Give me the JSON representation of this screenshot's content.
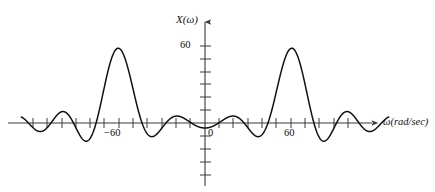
{
  "figure": {
    "name": "fourier-transform-magnitude-spectrum",
    "background_color": "#ffffff",
    "curve_color": "#111111",
    "axis_color": "#3a3a3a"
  },
  "labels": {
    "y_axis_label": "X(ω)",
    "x_axis_label": "ω(rad/sec)",
    "y_tick_60": "60",
    "x_tick_neg60": "−60",
    "x_tick_zero": "0",
    "x_tick_pos60": "60"
  },
  "chart_data": {
    "type": "line",
    "title": "",
    "xlabel": "ω(rad/sec)",
    "ylabel": "X(ω)",
    "xlim": [
      -135,
      150
    ],
    "ylim": [
      -50,
      72
    ],
    "grid": false,
    "legend": null,
    "x_ticks": [
      -120,
      -110,
      -100,
      -90,
      -80,
      -70,
      -60,
      -50,
      -40,
      -30,
      -20,
      -10,
      0,
      10,
      20,
      30,
      40,
      50,
      60,
      70,
      80,
      90,
      100,
      110,
      120
    ],
    "x_tick_labels": {
      "-60": "−60",
      "0": "0",
      "60": "60"
    },
    "y_ticks": [
      -40,
      -30,
      -20,
      -10,
      0,
      10,
      20,
      30,
      40,
      50,
      60,
      70
    ],
    "y_tick_labels": {
      "60": "60"
    },
    "peaks": [
      {
        "x": -60,
        "y": 60,
        "name": "main-lobe-negative"
      },
      {
        "x": 60,
        "y": 60,
        "name": "main-lobe-positive"
      }
    ],
    "x": [
      -128,
      -124,
      -120,
      -116,
      -112,
      -108,
      -104,
      -100,
      -96,
      -92,
      -88,
      -84,
      -80,
      -76,
      -72,
      -68,
      -64,
      -60,
      -56,
      -52,
      -48,
      -44,
      -40,
      -36,
      -32,
      -28,
      -24,
      -20,
      -16,
      -12,
      -8,
      -4,
      0,
      4,
      8,
      12,
      16,
      20,
      24,
      28,
      32,
      36,
      40,
      44,
      48,
      52,
      56,
      60,
      64,
      68,
      72,
      76,
      80,
      84,
      88,
      92,
      96,
      100,
      104,
      108,
      112,
      116,
      120,
      124,
      128
    ],
    "y": [
      0,
      3.2,
      6.0,
      6.6,
      4.0,
      -0.6,
      -5.4,
      -8.2,
      -7.2,
      -1.6,
      8.4,
      23.0,
      39.0,
      52.0,
      59.0,
      60.0,
      55.0,
      44.0,
      29.0,
      14.0,
      2.0,
      -5.4,
      -8.0,
      -6.0,
      -1.4,
      3.6,
      6.6,
      6.4,
      3.0,
      -1.4,
      -4.6,
      -5.0,
      -2.6,
      -5.0,
      -4.6,
      -1.4,
      3.0,
      6.4,
      6.6,
      3.6,
      -1.4,
      -6.0,
      -8.0,
      -5.4,
      2.0,
      14.0,
      29.0,
      44.0,
      55.0,
      60.0,
      59.0,
      52.0,
      39.0,
      23.0,
      8.4,
      -1.6,
      -7.2,
      -8.2,
      -5.4,
      -0.6,
      4.0,
      6.6,
      6.0,
      3.2,
      0
    ]
  },
  "geometry": {
    "x_axis_y_px": 123,
    "y_axis_x_px": 205,
    "px_per_unit_x": 1.435,
    "px_per_unit_y": 1.283,
    "x_axis_start_px": 8,
    "x_axis_end_px": 378,
    "y_axis_top_px": 18,
    "y_axis_bottom_px": 186
  }
}
